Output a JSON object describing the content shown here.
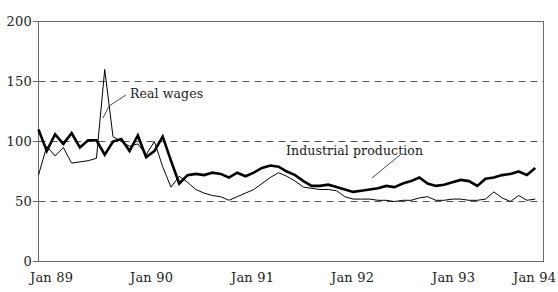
{
  "chart_data": {
    "type": "line",
    "title": "",
    "subtitle": "",
    "xlabel": "",
    "ylabel": "",
    "xlim": [
      0,
      61
    ],
    "ylim": [
      0,
      200
    ],
    "yticks": [
      0,
      50,
      100,
      150,
      200
    ],
    "ytick_labels": [
      "0",
      "50",
      "100",
      "150",
      "200"
    ],
    "xticks": [
      0,
      12,
      24,
      36,
      48,
      60
    ],
    "xtick_labels": [
      "Jan 89",
      "Jan 90",
      "Jan 91",
      "Jan 92",
      "Jan 93",
      "Jan 94"
    ],
    "grid": "horizontal-dashed-at-50-100-150",
    "legend": "none-inline-annotations",
    "annotations": [
      {
        "text": "Real wages",
        "target_series": "Real wages",
        "leader": true
      },
      {
        "text": "Industrial production",
        "target_series": "Industrial production",
        "leader": true
      }
    ],
    "series": [
      {
        "name": "Industrial production",
        "style": "thick-solid-black",
        "color": "#000000",
        "x": [
          0,
          1,
          2,
          3,
          4,
          5,
          6,
          7,
          8,
          9,
          10,
          11,
          12,
          13,
          14,
          15,
          16,
          17,
          18,
          19,
          20,
          21,
          22,
          23,
          24,
          25,
          26,
          27,
          28,
          29,
          30,
          31,
          32,
          33,
          34,
          35,
          36,
          37,
          38,
          39,
          40,
          41,
          42,
          43,
          44,
          45,
          46,
          47,
          48,
          49,
          50,
          51,
          52,
          53,
          54,
          55,
          56,
          57,
          58,
          59,
          60
        ],
        "values": [
          110,
          92,
          106,
          98,
          107,
          95,
          101,
          101,
          89,
          100,
          102,
          92,
          105,
          87,
          92,
          104,
          84,
          65,
          72,
          73,
          72,
          74,
          73,
          70,
          74,
          71,
          74,
          78,
          80,
          79,
          75,
          72,
          67,
          63,
          63,
          64,
          62,
          60,
          58,
          59,
          60,
          61,
          63,
          62,
          65,
          67,
          70,
          65,
          63,
          64,
          66,
          68,
          67,
          63,
          69,
          70,
          72,
          73,
          75,
          72,
          78
        ]
      },
      {
        "name": "Real wages",
        "style": "thin-solid-black",
        "color": "#000000",
        "x": [
          0,
          1,
          2,
          3,
          4,
          5,
          6,
          7,
          8,
          9,
          10,
          11,
          12,
          13,
          14,
          15,
          16,
          17,
          18,
          19,
          20,
          21,
          22,
          23,
          24,
          25,
          26,
          27,
          28,
          29,
          30,
          31,
          32,
          33,
          34,
          35,
          36,
          37,
          38,
          39,
          40,
          41,
          42,
          43,
          44,
          45,
          46,
          47,
          48,
          49,
          50,
          51,
          52,
          53,
          54,
          55,
          56,
          57,
          58,
          59,
          60
        ],
        "values": [
          72,
          96,
          88,
          95,
          82,
          83,
          84,
          86,
          160,
          104,
          100,
          96,
          98,
          89,
          100,
          79,
          62,
          71,
          66,
          60,
          57,
          55,
          54,
          51,
          54,
          57,
          60,
          65,
          70,
          74,
          71,
          67,
          62,
          61,
          60,
          60,
          59,
          54,
          52,
          52,
          52,
          51,
          51,
          50,
          51,
          51,
          53,
          54,
          51,
          51,
          52,
          52,
          51,
          51,
          52,
          58,
          53,
          50,
          55,
          51,
          52
        ]
      }
    ]
  },
  "axis": {
    "ytick_0": "0",
    "ytick_50": "50",
    "ytick_100": "100",
    "ytick_150": "150",
    "ytick_200": "200",
    "xtick_0": "Jan 89",
    "xtick_1": "Jan 90",
    "xtick_2": "Jan 91",
    "xtick_3": "Jan 92",
    "xtick_4": "Jan 93",
    "xtick_5": "Jan 94"
  },
  "annotations": {
    "real_wages": "Real wages",
    "industrial_production": "Industrial production"
  },
  "colors": {
    "line": "#000000",
    "grid": "#555555",
    "frame": "#666666",
    "text": "#1a1a1a",
    "background": "#ffffff"
  }
}
